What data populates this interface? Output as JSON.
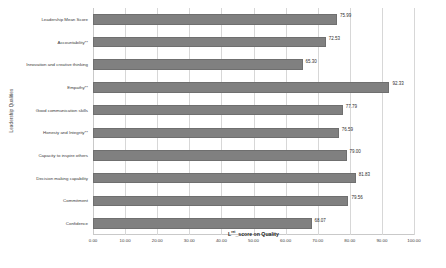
{
  "chart_data": {
    "type": "bar",
    "orientation": "horizontal",
    "title": "",
    "xlabel": "Lᴿᴱᵀ_score on Quality",
    "xlabel_main": "L",
    "xlabel_sup": "ret",
    "xlabel_rest": "_score on Quality",
    "ylabel": "Leadership Qualities",
    "categories": [
      "Leadership Mean Score",
      "Accountability**",
      "Innovation and creative thinking",
      "Empathy**",
      "Good communication skills",
      "Honesty and Integrity**",
      "Capacity to inspire others",
      "Decision making capability",
      "Commitment",
      "Confidence"
    ],
    "values": [
      75.99,
      72.53,
      65.3,
      92.33,
      77.79,
      76.59,
      79.0,
      81.83,
      79.56,
      68.07
    ],
    "value_labels": [
      "75.99",
      "72.53",
      "65.30",
      "92.33",
      "77.79",
      "76.59",
      "79.00",
      "81.83",
      "79.56",
      "68.07"
    ],
    "xlim": [
      0,
      100
    ],
    "xticks": [
      0,
      10,
      20,
      30,
      40,
      50,
      60,
      70,
      80,
      90,
      100
    ],
    "xticklabels": [
      "0.00",
      "10.00",
      "20.00",
      "30.00",
      "40.00",
      "50.00",
      "60.00",
      "70.00",
      "80.00",
      "90.00",
      "100.00"
    ],
    "grid": true,
    "legend": false,
    "bar_color": "#808080",
    "grid_color": "#d7d7d7",
    "axis_color": "#c9c9c9",
    "text_color": "#3a3a3a"
  }
}
